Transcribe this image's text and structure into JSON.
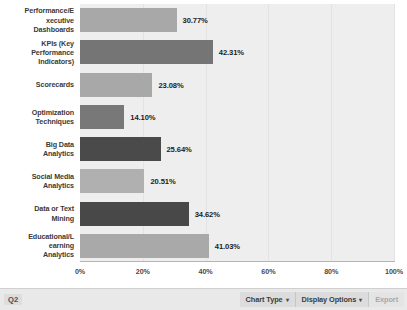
{
  "chart_data": {
    "type": "bar",
    "orientation": "horizontal",
    "title": "",
    "xlabel": "",
    "ylabel": "",
    "xlim": [
      0,
      100
    ],
    "grid": true,
    "legend": "none",
    "categories": [
      "Performance/Executive Dashboards",
      "KPIs (Key Performance Indicators)",
      "Scorecards",
      "Optimization Techniques",
      "Big Data Analytics",
      "Social Media Analytics",
      "Data or Text Mining",
      "Educational/Learning Analytics"
    ],
    "category_lines": [
      [
        "Performance/E",
        "xecutive",
        "Dashboards"
      ],
      [
        "KPIs (Key",
        "Performance",
        "Indicators)"
      ],
      [
        "Scorecards"
      ],
      [
        "Optimization",
        "Techniques"
      ],
      [
        "Big Data",
        "Analytics"
      ],
      [
        "Social Media",
        "Analytics"
      ],
      [
        "Data or Text",
        "Mining"
      ],
      [
        "Educational/L",
        "earning",
        "Analytics"
      ]
    ],
    "values": [
      30.77,
      42.31,
      23.08,
      14.1,
      25.64,
      20.51,
      34.62,
      41.03
    ],
    "value_labels": [
      "30.77%",
      "42.31%",
      "23.08%",
      "14.10%",
      "25.64%",
      "20.51%",
      "34.62%",
      "41.03%"
    ],
    "bar_colors": [
      "#a8a8a8",
      "#757575",
      "#a8a8a8",
      "#787878",
      "#4a4a4a",
      "#b0b0b0",
      "#484848",
      "#a9a9a9"
    ],
    "xticks": [
      0,
      20,
      40,
      60,
      80,
      100
    ],
    "xtick_labels": [
      "0%",
      "20%",
      "40%",
      "60%",
      "80%",
      "100%"
    ],
    "plot_bgcolor": "#eeeeee"
  },
  "toolbar": {
    "slide_label": "Q2",
    "chart_type_label": "Chart Type",
    "display_options_label": "Display Options",
    "export_label": "Export",
    "caret_glyph": "▾"
  }
}
